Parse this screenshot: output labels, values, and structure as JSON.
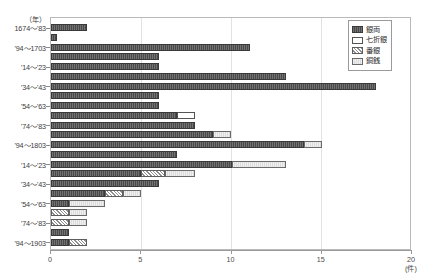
{
  "axes": {
    "y_unit": "（年）",
    "x_unit": "(件)",
    "x_ticks": [
      "0",
      "5",
      "10",
      "15",
      "20"
    ],
    "y_labels": [
      "1674～'83",
      "'94～1703",
      "'14～'23",
      "'34～'43",
      "'54～'63",
      "'74～'83",
      "'94～1803",
      "'14～'23",
      "'34～'43",
      "'54～'63",
      "'74～'83",
      "'94～1903"
    ]
  },
  "legend": {
    "items": [
      {
        "label": "銀両",
        "pattern": "ginryo"
      },
      {
        "label": "七折銀",
        "pattern": "nanaori"
      },
      {
        "label": "番銀",
        "pattern": "bangin"
      },
      {
        "label": "銅銭",
        "pattern": "dosen"
      }
    ]
  },
  "chart_data": {
    "type": "bar",
    "orientation": "horizontal",
    "stacked": true,
    "title": "",
    "xlabel": "(件)",
    "ylabel": "（年）",
    "xlim": [
      0,
      20
    ],
    "grid": true,
    "legend_position": "top-right",
    "categories": [
      "1674～'83",
      "",
      "'94～1703",
      "",
      "'14～'23",
      "",
      "'34～'43",
      "",
      "'54～'63",
      "",
      "'74～'83",
      "",
      "'94～1803",
      "",
      "'14～'23",
      "",
      "'34～'43",
      "",
      "'54～'63",
      "",
      "'74～'83",
      "",
      "'94～1903"
    ],
    "series": [
      {
        "name": "銀両",
        "values": [
          2,
          0.35,
          11,
          6,
          6,
          13,
          18,
          6,
          6,
          7,
          8,
          9,
          14,
          7,
          10,
          5,
          6,
          3,
          1,
          0,
          0,
          1,
          1
        ]
      },
      {
        "name": "七折銀",
        "values": [
          0,
          0,
          0,
          0,
          0,
          0,
          0,
          0,
          0,
          1,
          0,
          0,
          0,
          0,
          0,
          0,
          0,
          0,
          0,
          0,
          0,
          0,
          0
        ]
      },
      {
        "name": "番銀",
        "values": [
          0,
          0,
          0,
          0,
          0,
          0,
          0,
          0,
          0,
          0,
          0,
          0,
          0,
          0,
          0,
          1.3,
          0,
          1,
          0,
          1,
          1,
          0,
          1
        ]
      },
      {
        "name": "銅銭",
        "values": [
          0,
          0,
          0,
          0,
          0,
          0,
          0,
          0,
          0,
          0,
          0,
          1,
          1,
          0,
          3,
          1.7,
          0,
          1,
          2,
          1,
          1,
          0,
          0
        ]
      }
    ],
    "totals": [
      2,
      0.35,
      11,
      6,
      6,
      13,
      18,
      6,
      6,
      8,
      8,
      10,
      15,
      7,
      13,
      8,
      6,
      5,
      3,
      2,
      2,
      1,
      2
    ]
  }
}
